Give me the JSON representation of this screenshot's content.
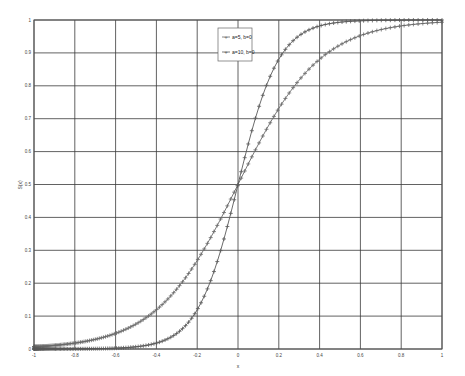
{
  "chart_data": {
    "type": "line",
    "title": "",
    "xlabel": "x",
    "ylabel": "S(x)",
    "xlim": [
      -1,
      1
    ],
    "ylim": [
      0,
      1
    ],
    "grid": true,
    "legend_position": "upper center",
    "x_ticks": [
      -1,
      -0.8,
      -0.6,
      -0.4,
      -0.2,
      0,
      0.2,
      0.4,
      0.6,
      0.8,
      1
    ],
    "x_tick_labels": [
      "-1",
      "-0.8",
      "-0.6",
      "-0.4",
      "-0.2",
      "0",
      "0.2",
      "0.4",
      "0.6",
      "0.8",
      "1"
    ],
    "y_ticks": [
      0,
      0.1,
      0.2,
      0.3,
      0.4,
      0.5,
      0.6,
      0.7,
      0.8,
      0.9,
      1
    ],
    "y_tick_labels": [
      "0",
      "0.1",
      "0.2",
      "0.3",
      "0.4",
      "0.5",
      "0.6",
      "0.7",
      "0.8",
      "0.9",
      "1"
    ],
    "function": "S(x) = 1 / (1 + exp(-a (x - b)))",
    "series": [
      {
        "name": "a=5, b=0",
        "a": 5,
        "b": 0,
        "marker": "+",
        "color": "#6a6a6a",
        "x": [
          -1,
          -0.8,
          -0.6,
          -0.4,
          -0.2,
          0,
          0.2,
          0.4,
          0.6,
          0.8,
          1
        ],
        "values": [
          0.0067,
          0.018,
          0.047,
          0.119,
          0.269,
          0.5,
          0.731,
          0.881,
          0.953,
          0.982,
          0.993
        ]
      },
      {
        "name": "a=10, b=0",
        "a": 10,
        "b": 0,
        "marker": "+",
        "color": "#5a5a5a",
        "x": [
          -1,
          -0.8,
          -0.6,
          -0.4,
          -0.2,
          0,
          0.2,
          0.4,
          0.6,
          0.8,
          1
        ],
        "values": [
          5e-05,
          0.0003,
          0.0025,
          0.018,
          0.119,
          0.5,
          0.881,
          0.982,
          0.9975,
          0.9997,
          0.99995
        ]
      }
    ]
  },
  "legend": {
    "items": [
      "a=5, b=0",
      "a=10, b=0"
    ]
  }
}
